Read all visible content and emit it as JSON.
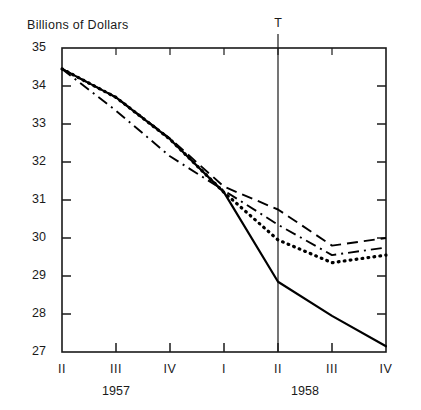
{
  "chart_data": {
    "type": "line",
    "title": "Billions of Dollars",
    "ylabel": "Billions of Dollars",
    "xlabel": "",
    "ylim": [
      27,
      35
    ],
    "ytick_labels": [
      "35",
      "34",
      "33",
      "32",
      "31",
      "30",
      "29",
      "28",
      "27"
    ],
    "ytick_values": [
      35,
      34,
      33,
      32,
      31,
      30,
      29,
      28,
      27
    ],
    "grid": false,
    "legend_position": "none",
    "x": [
      "II",
      "III",
      "IV",
      "I",
      "II",
      "III",
      "IV"
    ],
    "categories": [
      "II",
      "III",
      "IV",
      "I",
      "II",
      "III",
      "IV"
    ],
    "group_labels": [
      {
        "label": "1957",
        "spans": [
          "II",
          "III",
          "IV"
        ]
      },
      {
        "label": "1958",
        "spans": [
          "I",
          "II",
          "III",
          "IV"
        ]
      }
    ],
    "annotations": [
      {
        "text": "T",
        "x": "II",
        "x_group": "1958",
        "type": "vertical-marker-line"
      }
    ],
    "series": [
      {
        "name": "solid",
        "style": "solid",
        "color": "#000000",
        "values": [
          34.45,
          33.7,
          32.6,
          31.2,
          28.85,
          27.95,
          27.15
        ]
      },
      {
        "name": "dashed",
        "style": "dashed",
        "color": "#000000",
        "values": [
          34.45,
          33.7,
          32.62,
          31.35,
          30.75,
          29.8,
          30.0
        ]
      },
      {
        "name": "dash-dot",
        "style": "dash-dot",
        "color": "#000000",
        "values": [
          34.45,
          33.35,
          32.15,
          31.25,
          30.35,
          29.55,
          29.75
        ]
      },
      {
        "name": "dotted",
        "style": "dotted",
        "color": "#000000",
        "values": [
          34.45,
          33.7,
          32.6,
          31.2,
          29.95,
          29.35,
          29.55
        ]
      }
    ]
  },
  "axis_title_text": "Billions of Dollars",
  "t_marker_text": "T",
  "year_labels": {
    "first": "1957",
    "second": "1958"
  }
}
